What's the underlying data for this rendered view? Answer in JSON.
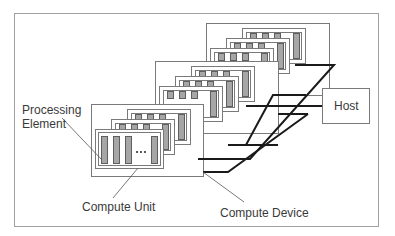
{
  "labels": {
    "processing_element": [
      "Processing",
      "Element"
    ],
    "compute_unit": "Compute Unit",
    "compute_device": "Compute Device",
    "host": "Host",
    "ellipsis": "..."
  },
  "colors": {
    "frame": "#9a9a9a",
    "box_stroke": "#7a7a7a",
    "pe_fill": "#a6a6a6",
    "pe_stroke": "#5e5e5e",
    "bus": "#1a1a1a",
    "text": "#3a3a3a"
  },
  "structure": {
    "compute_devices": 3,
    "compute_units_per_device": 3,
    "processing_elements_per_unit": "3 + ... + 1"
  }
}
